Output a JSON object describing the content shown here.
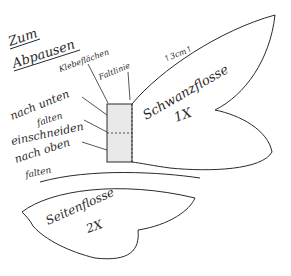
{
  "title": {
    "line1": "Zum",
    "line2": "Abpausen"
  },
  "labels": {
    "klebeflaechen": "Klebeflächen",
    "faltlinie": "Faltlinie",
    "nach_unten": "nach unten",
    "falten1": "falten",
    "einschneiden": "einschneiden",
    "nach_oben": "nach oben",
    "falten2": "falten"
  },
  "tail_fin": {
    "name": "Schwanzflosse",
    "count": "1X",
    "measure": "↑3cm↑"
  },
  "side_fin": {
    "name": "Seitenflosse",
    "count": "2X"
  },
  "colors": {
    "ink": "#2a2a2a",
    "tab_fill": "#e9e9e9",
    "paper": "#ffffff"
  }
}
